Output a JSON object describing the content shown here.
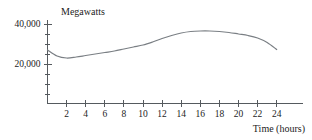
{
  "chart_data": {
    "type": "line",
    "title": "",
    "xlabel": "Time (hours)",
    "ylabel": "Megawatts",
    "xlim": [
      0,
      25
    ],
    "ylim": [
      0,
      42500
    ],
    "grid": false,
    "legend": null,
    "x_ticks": [
      2,
      4,
      6,
      8,
      10,
      12,
      14,
      16,
      18,
      20,
      22,
      24
    ],
    "x_tick_labels": [
      "2",
      "4",
      "6",
      "8",
      "10",
      "12",
      "14",
      "16",
      "18",
      "20",
      "22",
      "24"
    ],
    "y_ticks": [
      20000,
      40000
    ],
    "y_tick_labels": [
      "20,000",
      "40,000"
    ],
    "y_minor_tick_count": 9,
    "series": [
      {
        "name": "Power demand",
        "color": "#7a7f84",
        "x": [
          0,
          1,
          2,
          3,
          4,
          5,
          6,
          7,
          8,
          9,
          10,
          11,
          12,
          13,
          14,
          15,
          16,
          17,
          18,
          19,
          20,
          21,
          22,
          23,
          24
        ],
        "values": [
          27000,
          24000,
          23000,
          23500,
          24250,
          25000,
          25750,
          26500,
          27500,
          28500,
          29500,
          31000,
          32750,
          34250,
          35500,
          36250,
          36500,
          36500,
          36250,
          35750,
          35000,
          34250,
          33000,
          30750,
          27250
        ]
      }
    ]
  },
  "axes": {
    "y_title": "Megawatts",
    "x_title": "Time (hours)"
  }
}
